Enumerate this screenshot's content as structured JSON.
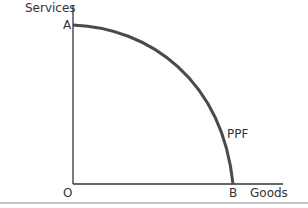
{
  "diagram": {
    "y_axis_label": "Services",
    "x_axis_label": "Goods",
    "origin_label": "O",
    "point_a_label": "A",
    "point_b_label": "B",
    "curve_label": "PPF",
    "colors": {
      "curve": "#4a4a4a",
      "axis": "#333333",
      "text": "#333333"
    }
  }
}
